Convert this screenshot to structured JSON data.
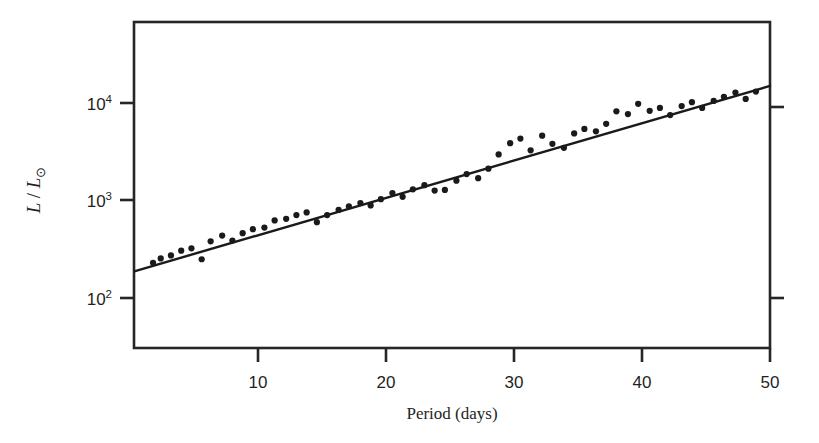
{
  "figure": {
    "background_color": "#ffffff",
    "foreground_color": "#1f1f1f"
  },
  "axes": {
    "frame_color": "#262626",
    "x_title": "Period (days)",
    "y_title_main": "L / L",
    "y_title_sub": "⊙",
    "y_title_numerator": "L",
    "y_title_slash": "/",
    "y_title_denominator": "L",
    "x_tick_labels": [
      "10",
      "20",
      "30",
      "40",
      "50"
    ],
    "y_tick_mantissa": "10",
    "y_tick_exponents": [
      "2",
      "3",
      "4"
    ]
  },
  "chart_data": {
    "type": "scatter",
    "title": "",
    "subtitle": "",
    "xlabel": "Period (days)",
    "ylabel": "L / L⊙",
    "xlim": [
      0.3,
      50
    ],
    "ylim": [
      39,
      38000
    ],
    "yscale": "log",
    "xscale": "linear",
    "grid": false,
    "legend": null,
    "x_ticks": [
      10,
      20,
      30,
      40,
      50
    ],
    "y_ticks": [
      100,
      1000,
      10000
    ],
    "y_tick_labels": [
      "10^2",
      "10^3",
      "10^4"
    ],
    "marker_color": "#1a1a1a",
    "marker_size": 4,
    "series": [
      {
        "name": "Cepheid variables",
        "type": "scatter",
        "x": [
          1.8,
          2.4,
          3.2,
          4.0,
          4.8,
          5.6,
          6.3,
          7.2,
          8.0,
          8.8,
          9.6,
          10.5,
          11.3,
          12.2,
          13.0,
          13.8,
          14.6,
          15.4,
          16.3,
          17.1,
          18.0,
          18.8,
          19.6,
          20.5,
          21.3,
          22.1,
          23.0,
          23.8,
          24.6,
          25.5,
          26.3,
          27.2,
          28.0,
          28.8,
          29.7,
          30.5,
          31.3,
          32.2,
          33.0,
          33.9,
          34.7,
          35.5,
          36.4,
          37.2,
          38.0,
          38.9,
          39.7,
          40.6,
          41.4,
          42.2,
          43.1,
          43.9,
          44.7,
          45.6,
          46.4,
          47.3,
          48.1,
          48.9
        ],
        "y": [
          225,
          250,
          268,
          300,
          318,
          245,
          375,
          430,
          382,
          455,
          500,
          520,
          615,
          640,
          700,
          745,
          590,
          700,
          790,
          860,
          930,
          880,
          1020,
          1180,
          1080,
          1290,
          1420,
          1250,
          1270,
          1580,
          1850,
          1680,
          2100,
          2950,
          3850,
          4300,
          3250,
          4600,
          3800,
          3450,
          4850,
          5400,
          5100,
          6100,
          8200,
          7700,
          9800,
          8300,
          8900,
          7500,
          9300,
          10200,
          8900,
          10500,
          11600,
          12800,
          11000,
          13100
        ]
      },
      {
        "name": "Best-fit period-luminosity relation",
        "type": "line",
        "color": "#1a1a1a",
        "x": [
          0.4,
          50
        ],
        "y": [
          185,
          15000
        ]
      }
    ]
  }
}
